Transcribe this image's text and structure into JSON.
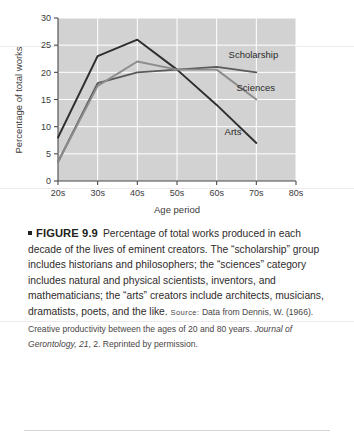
{
  "figure": {
    "bullet": "square-bullet",
    "label": "FIGURE 9.9",
    "body_part1": "Percentage of total works produced in each decade of the lives of eminent creators. The “scholarship” group includes historians and philosophers; the “sciences” category includes natural and physical scientists, inventors, and mathematicians; the “arts” creators include architects, musicians, dramatists, poets, and the like. ",
    "source_label": "Source:",
    "source_text_1": " Data from Dennis, W. (1966). Creative productivity between the ages of 20 and 80 years. ",
    "source_journal": "Journal of Gerontology, 21",
    "source_text_2": ", 2. Reprinted by permission."
  },
  "chart_data": {
    "type": "line",
    "title": "",
    "xlabel": "Age period",
    "ylabel": "Percentage of total works",
    "categories": [
      "20s",
      "30s",
      "40s",
      "50s",
      "60s",
      "70s",
      "80s"
    ],
    "x_tick_labels": [
      "20s",
      "30s",
      "40s",
      "50s",
      "60s",
      "70s",
      "80s"
    ],
    "y_tick_labels": [
      "0",
      "5",
      "10",
      "15",
      "20",
      "25",
      "30"
    ],
    "y_ticks": [
      0,
      5,
      10,
      15,
      20,
      25,
      30
    ],
    "ylim": [
      0,
      30
    ],
    "xlim": [
      "20s",
      "80s"
    ],
    "grid": true,
    "grid_color": "#ffffff",
    "plot_bg": "#d2d2d2",
    "legend_position": "inline-right",
    "series": [
      {
        "name": "Arts",
        "color": "#2e2e2e",
        "x": [
          "20s",
          "30s",
          "40s",
          "50s",
          "60s",
          "70s"
        ],
        "values": [
          8,
          23,
          26,
          20.5,
          14,
          7
        ],
        "label_text": "Arts"
      },
      {
        "name": "Scholarship",
        "color": "#5a5a5a",
        "x": [
          "20s",
          "30s",
          "40s",
          "50s",
          "60s",
          "70s"
        ],
        "values": [
          3.5,
          18,
          20,
          20.5,
          21,
          20
        ],
        "label_text": "Scholarship"
      },
      {
        "name": "Sciences",
        "color": "#8c8c8c",
        "x": [
          "20s",
          "30s",
          "40s",
          "50s",
          "60s",
          "70s"
        ],
        "values": [
          3.5,
          17.5,
          22,
          20.5,
          20.5,
          15
        ],
        "label_text": "Sciences"
      }
    ],
    "annotations": [
      {
        "text": "Scholarship",
        "x": "63s",
        "y": 22.6
      },
      {
        "text": "Sciences",
        "x": "65s",
        "y": 16.6
      },
      {
        "text": "Arts",
        "x": "62s",
        "y": 8.4
      }
    ]
  }
}
